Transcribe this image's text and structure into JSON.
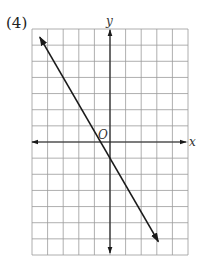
{
  "problem": {
    "number_label": "(4)"
  },
  "chart_data": {
    "type": "line",
    "title": "",
    "xlabel": "x",
    "ylabel": "y",
    "origin_label": "O",
    "grid": true,
    "xlim": [
      -5,
      5
    ],
    "ylim": [
      -7,
      7
    ],
    "grid_columns": 10,
    "grid_rows": 14,
    "axes_arrows": true,
    "series": [
      {
        "name": "line",
        "equation": "y = -5/3 x - 1",
        "slope": -1.6667,
        "intercept": -1,
        "x": [
          -4.5,
          -3,
          0,
          3,
          3.1
        ],
        "y": [
          6.5,
          4,
          -1,
          -6,
          -6.17
        ],
        "arrows_both_ends": true
      }
    ]
  },
  "style": {
    "grid_color": "#9a9a9a",
    "axis_color": "#222222",
    "line_color": "#1a1a1a"
  }
}
